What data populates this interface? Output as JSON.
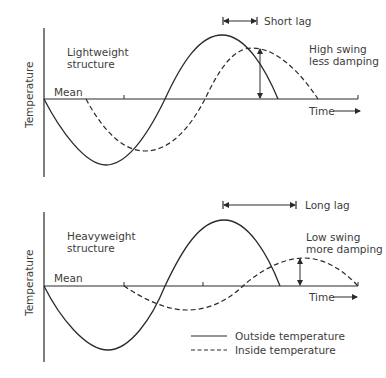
{
  "panels": [
    {
      "title": "Lightweight structure",
      "title_line1": "Lightweight",
      "title_line2": "structure",
      "y_label": "Temperature",
      "mean_label": "Mean",
      "x_label": "Time",
      "lag_label": "Short lag",
      "swing_line1": "High swing",
      "swing_line2": "less damping"
    },
    {
      "title": "Heavyweight structure",
      "title_line1": "Heavyweight",
      "title_line2": "structure",
      "y_label": "Temperature",
      "mean_label": "Mean",
      "x_label": "Time",
      "lag_label": "Long lag",
      "swing_line1": "Low swing",
      "swing_line2": "more damping"
    }
  ],
  "legend": {
    "outside": "Outside temperature",
    "inside": "Inside temperature"
  },
  "colors": {
    "line": "#2a2a2a",
    "text": "#3c3c3c",
    "background": "#ffffff"
  }
}
